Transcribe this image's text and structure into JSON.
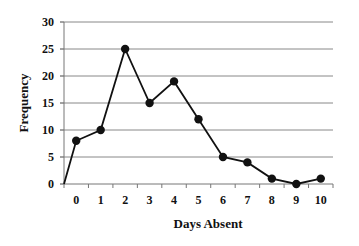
{
  "chart_data": {
    "type": "line",
    "title": "",
    "xlabel": "Days Absent",
    "ylabel": "Frequency",
    "categories": [
      "0",
      "1",
      "2",
      "3",
      "4",
      "5",
      "6",
      "7",
      "8",
      "9",
      "10"
    ],
    "x": [
      0,
      1,
      2,
      3,
      4,
      5,
      6,
      7,
      8,
      9,
      10
    ],
    "values": [
      8,
      10,
      25,
      15,
      19,
      12,
      5,
      4,
      1,
      0,
      1
    ],
    "line_start": {
      "x": -0.5,
      "y": 0
    },
    "ylim": [
      0,
      30
    ],
    "yticks": [
      0,
      5,
      10,
      15,
      20,
      25,
      30
    ],
    "grid": {
      "horizontal": true,
      "vertical": false
    },
    "legend": null,
    "marker": "circle",
    "line_color": "#111111",
    "grid_color": "#888888"
  }
}
